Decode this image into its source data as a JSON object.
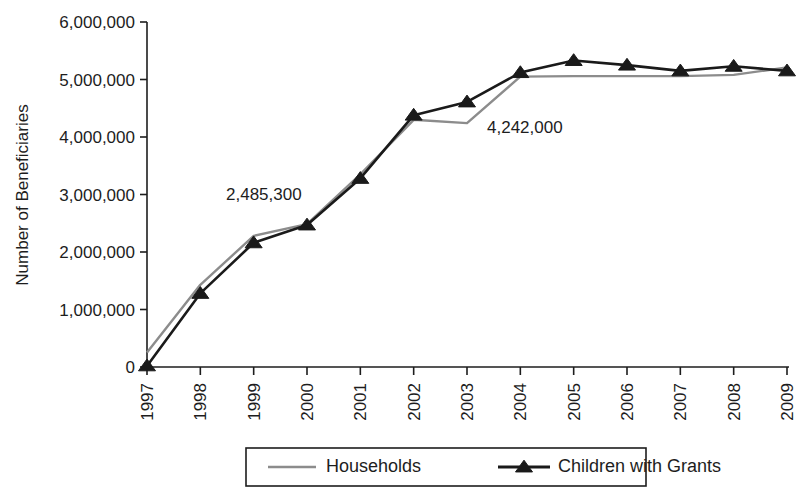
{
  "chart_data": {
    "type": "line",
    "title": "",
    "xlabel": "",
    "ylabel": "Number of Beneficiaries",
    "x": [
      "1997",
      "1998",
      "1999",
      "2000",
      "2001",
      "2002",
      "2003",
      "2004",
      "2005",
      "2006",
      "2007",
      "2008",
      "2009"
    ],
    "xlim": [
      1997,
      2009
    ],
    "ylim": [
      0,
      6000000
    ],
    "yticks": [
      0,
      1000000,
      2000000,
      3000000,
      4000000,
      5000000,
      6000000
    ],
    "ytick_labels": [
      "0",
      "1,000,000",
      "2,000,000",
      "3,000,000",
      "4,000,000",
      "5,000,000",
      "6,000,000"
    ],
    "grid": false,
    "legend_position": "bottom",
    "series": [
      {
        "name": "Households",
        "color": "#8c8c8c",
        "marker": "none",
        "values": [
          250000,
          1430000,
          2280000,
          2485300,
          3350000,
          4300000,
          4242000,
          5050000,
          5060000,
          5060000,
          5060000,
          5080000,
          5210000
        ]
      },
      {
        "name": "Children with Grants",
        "color": "#1a1a1a",
        "marker": "triangle",
        "values": [
          20000,
          1280000,
          2160000,
          2470000,
          3280000,
          4380000,
          4610000,
          5120000,
          5330000,
          5250000,
          5150000,
          5230000,
          5150000
        ]
      }
    ],
    "annotations": [
      {
        "text": "2,485,300",
        "x_px": 226,
        "y_px": 200
      },
      {
        "text": "4,242,000",
        "x_px": 487,
        "y_px": 133
      }
    ]
  },
  "legend": {
    "items": [
      {
        "label": "Households",
        "marker": "line-gray"
      },
      {
        "label": "Children with Grants",
        "marker": "line-triangle-black"
      }
    ]
  },
  "axes": {
    "y_title": "Number of Beneficiaries"
  }
}
